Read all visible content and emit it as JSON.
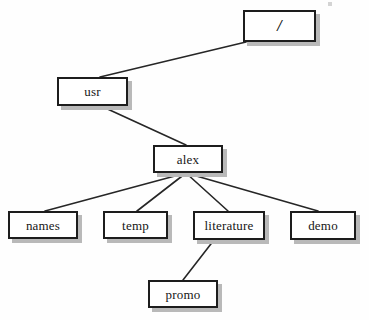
{
  "diagram": {
    "type": "tree",
    "background_color": "#fefefe",
    "box_border_color": "#1d1d1d",
    "box_fill_color": "#ffffff",
    "box_shadow_color": "#b9b9b9",
    "edge_color": "#262626",
    "nodes": [
      {
        "id": "root",
        "label": "/",
        "x": 243,
        "y": 10,
        "w": 73,
        "h": 32
      },
      {
        "id": "usr",
        "label": "usr",
        "x": 57,
        "y": 77,
        "w": 71,
        "h": 29
      },
      {
        "id": "alex",
        "label": "alex",
        "x": 153,
        "y": 145,
        "w": 70,
        "h": 28
      },
      {
        "id": "names",
        "label": "names",
        "x": 8,
        "y": 211,
        "w": 70,
        "h": 28
      },
      {
        "id": "temp",
        "label": "temp",
        "x": 103,
        "y": 211,
        "w": 65,
        "h": 28
      },
      {
        "id": "literature",
        "label": "literature",
        "x": 193,
        "y": 211,
        "w": 72,
        "h": 29
      },
      {
        "id": "demo",
        "label": "demo",
        "x": 290,
        "y": 211,
        "w": 66,
        "h": 29
      },
      {
        "id": "promo",
        "label": "promo",
        "x": 148,
        "y": 280,
        "w": 70,
        "h": 28
      }
    ],
    "edges": [
      {
        "from": "root",
        "to": "usr",
        "x1": 246,
        "y1": 42,
        "x2": 100,
        "y2": 77
      },
      {
        "from": "usr",
        "to": "alex",
        "x1": 101,
        "y1": 106,
        "x2": 186,
        "y2": 145
      },
      {
        "from": "alex",
        "to": "names",
        "x1": 186,
        "y1": 173,
        "x2": 45,
        "y2": 211
      },
      {
        "from": "alex",
        "to": "temp",
        "x1": 186,
        "y1": 173,
        "x2": 137,
        "y2": 211
      },
      {
        "from": "alex",
        "to": "literature",
        "x1": 186,
        "y1": 173,
        "x2": 228,
        "y2": 211
      },
      {
        "from": "alex",
        "to": "demo",
        "x1": 186,
        "y1": 173,
        "x2": 318,
        "y2": 211
      },
      {
        "from": "literature",
        "to": "promo",
        "x1": 214,
        "y1": 240,
        "x2": 183,
        "y2": 280
      }
    ]
  }
}
